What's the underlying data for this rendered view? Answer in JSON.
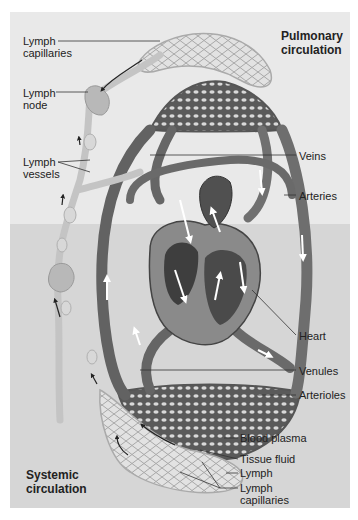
{
  "regions": {
    "pulmonary": [
      "Pulmonary",
      "circulation"
    ],
    "systemic": [
      "Systemic",
      "circulation"
    ]
  },
  "labels": {
    "lymph_capillaries_top": [
      "Lymph",
      "capillaries"
    ],
    "lymph_node": [
      "Lymph",
      "node"
    ],
    "lymph_vessels": [
      "Lymph",
      "vessels"
    ],
    "veins": "Veins",
    "arteries": "Arteries",
    "heart": "Heart",
    "venules": "Venules",
    "arterioles": "Arterioles",
    "blood_plasma": "Blood plasma",
    "tissue_fluid": "Tissue fluid",
    "lymph": "Lymph",
    "lymph_capillaries_bottom": [
      "Lymph",
      "capillaries"
    ]
  },
  "colors": {
    "bg_top": "#e9e9e9",
    "bg_bottom": "#d6d6d6",
    "vessel_dark": "#5c5c5c",
    "vessel_mid": "#7a7a7a",
    "lymph": "#c8c8c8",
    "arrow": "#ffffff",
    "leader": "#333333"
  }
}
